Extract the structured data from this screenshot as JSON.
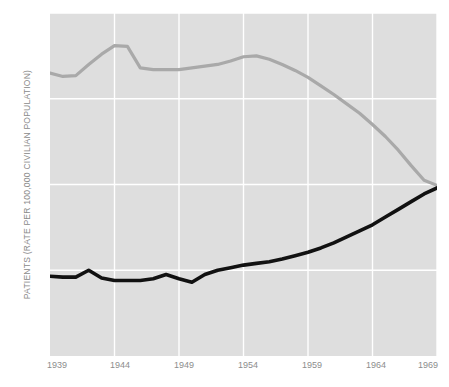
{
  "chart_data": {
    "type": "line",
    "title": "",
    "xlabel": "",
    "ylabel": "PATIENTS (RATE PER 100,000 CIVILIAN POPULATION)",
    "xlim": [
      1939,
      1969
    ],
    "ylim": [
      0,
      400
    ],
    "yticks": [
      0,
      100,
      200,
      300,
      400
    ],
    "ytick_labels": [
      "0",
      "100",
      "200",
      "300",
      "400"
    ],
    "xticks": [
      1939,
      1944,
      1949,
      1954,
      1959,
      1964,
      1969
    ],
    "xtick_labels": [
      "1939",
      "1944",
      "1949",
      "1954",
      "1959",
      "1964",
      "1969"
    ],
    "grid": true,
    "grid_color": "#ffffff",
    "plot_background": "#dedede",
    "legend": "none",
    "series": [
      {
        "name": "resident-patients-gray",
        "color": "#a9a9a9",
        "line_width": 3.2,
        "x": [
          1939,
          1940,
          1941,
          1942,
          1943,
          1944,
          1945,
          1946,
          1947,
          1948,
          1949,
          1950,
          1951,
          1952,
          1953,
          1954,
          1955,
          1956,
          1957,
          1958,
          1959,
          1960,
          1961,
          1962,
          1963,
          1964,
          1965,
          1966,
          1967,
          1968,
          1969
        ],
        "values": [
          330,
          326,
          327,
          340,
          352,
          362,
          361,
          336,
          334,
          334,
          334,
          336,
          338,
          340,
          344,
          349,
          350,
          346,
          340,
          333,
          325,
          315,
          305,
          294,
          283,
          270,
          256,
          240,
          222,
          205,
          199
        ]
      },
      {
        "name": "admissions-black",
        "color": "#111111",
        "line_width": 3.6,
        "x": [
          1939,
          1940,
          1941,
          1942,
          1943,
          1944,
          1945,
          1946,
          1947,
          1948,
          1949,
          1950,
          1951,
          1952,
          1953,
          1954,
          1955,
          1956,
          1957,
          1958,
          1959,
          1960,
          1961,
          1962,
          1963,
          1964,
          1965,
          1966,
          1967,
          1968,
          1969
        ],
        "values": [
          93,
          92,
          92,
          100,
          91,
          88,
          88,
          88,
          90,
          95,
          90,
          86,
          95,
          100,
          103,
          106,
          108,
          110,
          113,
          117,
          121,
          126,
          132,
          139,
          146,
          153,
          162,
          171,
          180,
          189,
          196
        ]
      }
    ]
  },
  "axes": {
    "y_title": "PATIENTS (RATE PER 100,000 CIVILIAN POPULATION)"
  }
}
